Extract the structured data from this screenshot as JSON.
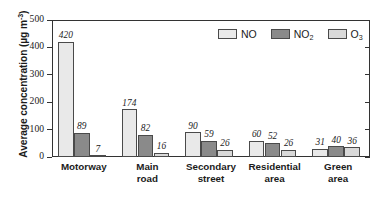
{
  "chart_data": {
    "type": "bar",
    "title": "",
    "subtitle": "",
    "xlabel": "",
    "ylabel": "Average concentration (µg m",
    "ylabel_exponent": "-3",
    "ylabel_full": "Average concentration (µg m⁻³)",
    "ylim": [
      0,
      500
    ],
    "yticks": [
      0,
      100,
      200,
      300,
      400,
      500
    ],
    "ytick_labels": [
      "0",
      "100",
      "200",
      "300",
      "400",
      "500"
    ],
    "grid": false,
    "legend_position": "top-right-inside",
    "categories": [
      "Motorway",
      "Main road",
      "Secondary street",
      "Residential area",
      "Green area"
    ],
    "category_lines": [
      [
        "Motorway"
      ],
      [
        "Main",
        "road"
      ],
      [
        "Secondary",
        "street"
      ],
      [
        "Residential",
        "area"
      ],
      [
        "Green",
        "area"
      ]
    ],
    "series": [
      {
        "name": "NO",
        "name_base": "NO",
        "name_sub": "",
        "color": "#e9e9e9",
        "values": [
          420,
          174,
          90,
          60,
          31
        ],
        "labels": [
          "420",
          "174",
          "90",
          "60",
          "31"
        ]
      },
      {
        "name": "NO2",
        "name_base": "NO",
        "name_sub": "2",
        "color": "#8a8a8a",
        "values": [
          89,
          82,
          59,
          52,
          40
        ],
        "labels": [
          "89",
          "82",
          "59",
          "52",
          "40"
        ]
      },
      {
        "name": "O3",
        "name_base": "O",
        "name_sub": "3",
        "color": "#d9d9d9",
        "values": [
          7,
          16,
          26,
          26,
          36
        ],
        "labels": [
          "7",
          "16",
          "26",
          "26",
          "36"
        ]
      }
    ],
    "bar_edge_color": "#4a4a4a",
    "axis_color": "#333333"
  }
}
